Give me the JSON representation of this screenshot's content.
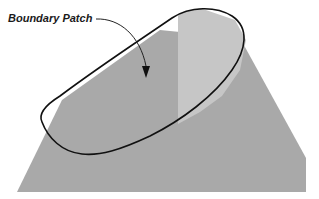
{
  "figure": {
    "annotation": {
      "label": "Boundary Patch"
    },
    "colors": {
      "cone_body": "#a8a8a8",
      "cone_light_facet": "#c4c4c4",
      "patch_fill": "#b0b0b0",
      "outline": "#111111",
      "background": "#ffffff"
    }
  }
}
